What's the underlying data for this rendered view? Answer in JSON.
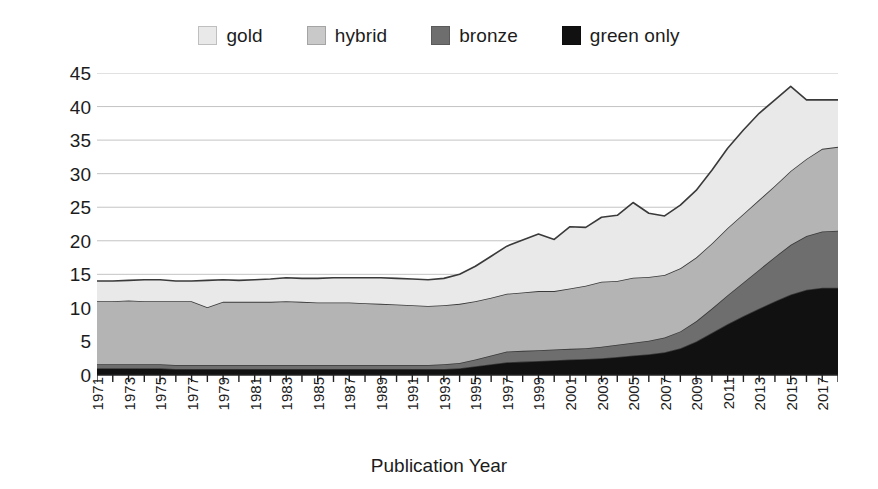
{
  "chart_data": {
    "type": "area",
    "title": "",
    "xlabel": "Publication Year",
    "ylabel": "Percentage of Publications",
    "ylim": [
      0,
      45
    ],
    "yticks": [
      0,
      5,
      10,
      15,
      20,
      25,
      30,
      35,
      40,
      45
    ],
    "grid": true,
    "grid_axis": "y",
    "legend_position": "top-center",
    "stacked": true,
    "stack_order_top_to_bottom": [
      "gold",
      "hybrid",
      "bronze",
      "green only"
    ],
    "x_tick_labels": [
      "1971",
      "1973",
      "1975",
      "1977",
      "1979",
      "1981",
      "1983",
      "1985",
      "1987",
      "1989",
      "1991",
      "1993",
      "1995",
      "1997",
      "1999",
      "2001",
      "2003",
      "2005",
      "2007",
      "2009",
      "2011",
      "2013",
      "2015",
      "2017"
    ],
    "x": [
      1971,
      1972,
      1973,
      1974,
      1975,
      1976,
      1977,
      1978,
      1979,
      1980,
      1981,
      1982,
      1983,
      1984,
      1985,
      1986,
      1987,
      1988,
      1989,
      1990,
      1991,
      1992,
      1993,
      1994,
      1995,
      1996,
      1997,
      1998,
      1999,
      2000,
      2001,
      2002,
      2003,
      2004,
      2005,
      2006,
      2007,
      2008,
      2009,
      2010,
      2011,
      2012,
      2013,
      2014,
      2015,
      2016,
      2017,
      2018
    ],
    "series": [
      {
        "name": "green only",
        "color": "#111111",
        "values": [
          1.0,
          1.0,
          1.0,
          1.0,
          1.0,
          0.9,
          0.9,
          0.9,
          0.9,
          0.9,
          0.9,
          0.9,
          0.9,
          0.9,
          0.9,
          0.9,
          0.9,
          0.9,
          0.9,
          0.9,
          0.9,
          0.9,
          0.9,
          1.0,
          1.3,
          1.6,
          1.9,
          2.0,
          2.1,
          2.2,
          2.3,
          2.4,
          2.5,
          2.7,
          2.9,
          3.1,
          3.4,
          4.0,
          5.0,
          6.3,
          7.6,
          8.8,
          9.9,
          11.0,
          12.0,
          12.7,
          13.0,
          13.0
        ]
      },
      {
        "name": "bronze",
        "color": "#6e6e6e",
        "values": [
          0.6,
          0.6,
          0.6,
          0.6,
          0.6,
          0.6,
          0.6,
          0.6,
          0.6,
          0.6,
          0.6,
          0.6,
          0.6,
          0.6,
          0.6,
          0.6,
          0.6,
          0.6,
          0.6,
          0.6,
          0.6,
          0.6,
          0.7,
          0.8,
          1.0,
          1.3,
          1.6,
          1.6,
          1.6,
          1.6,
          1.6,
          1.6,
          1.7,
          1.8,
          1.9,
          2.0,
          2.2,
          2.5,
          3.0,
          3.6,
          4.3,
          5.0,
          5.8,
          6.6,
          7.4,
          8.0,
          8.4,
          8.5
        ]
      },
      {
        "name": "hybrid",
        "color": "#b4b4b4",
        "values": [
          9.4,
          9.4,
          9.5,
          9.4,
          9.4,
          9.5,
          9.5,
          8.6,
          9.4,
          9.4,
          9.4,
          9.4,
          9.5,
          9.4,
          9.3,
          9.3,
          9.3,
          9.2,
          9.1,
          9.0,
          8.9,
          8.8,
          8.8,
          8.8,
          8.7,
          8.6,
          8.6,
          8.7,
          8.8,
          8.7,
          9.0,
          9.3,
          9.7,
          9.5,
          9.7,
          9.5,
          9.3,
          9.4,
          9.5,
          9.7,
          10.0,
          10.2,
          10.4,
          10.6,
          11.0,
          11.5,
          12.3,
          12.5
        ]
      },
      {
        "name": "gold",
        "color": "#e9e9e9",
        "values": [
          3.0,
          3.0,
          3.0,
          3.2,
          3.2,
          3.0,
          3.0,
          4.0,
          3.3,
          3.2,
          3.3,
          3.4,
          3.5,
          3.5,
          3.6,
          3.7,
          3.7,
          3.8,
          3.9,
          3.9,
          3.9,
          3.9,
          4.0,
          4.4,
          5.2,
          6.2,
          7.1,
          7.8,
          8.5,
          7.7,
          9.2,
          8.7,
          9.6,
          9.8,
          11.2,
          9.5,
          8.8,
          9.4,
          10.0,
          10.9,
          11.9,
          12.5,
          12.9,
          12.8,
          12.6,
          8.8,
          7.3,
          7.0
        ]
      }
    ],
    "legend": [
      {
        "label": "gold",
        "color": "#e9e9e9"
      },
      {
        "label": "hybrid",
        "color": "#c9c9c9"
      },
      {
        "label": "bronze",
        "color": "#6e6e6e"
      },
      {
        "label": "green only",
        "color": "#111111"
      }
    ]
  }
}
